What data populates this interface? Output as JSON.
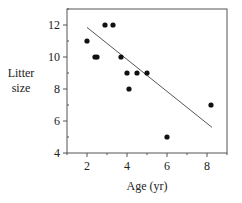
{
  "chart_data": {
    "type": "scatter",
    "title": "",
    "xlabel": "Age (yr)",
    "ylabel": [
      "Litter",
      "size"
    ],
    "xlim": [
      1,
      9
    ],
    "ylim": [
      4,
      13
    ],
    "x_ticks": [
      2,
      4,
      6,
      8
    ],
    "x_minor_ticks": [
      1,
      3,
      5,
      7,
      9
    ],
    "y_ticks": [
      4,
      6,
      8,
      10,
      12
    ],
    "y_minor_ticks": [
      5,
      7,
      9,
      11,
      13
    ],
    "grid": false,
    "legend": null,
    "series": [
      {
        "name": "observations",
        "type": "scatter",
        "points": [
          {
            "x": 2.0,
            "y": 11
          },
          {
            "x": 2.4,
            "y": 10
          },
          {
            "x": 2.5,
            "y": 10
          },
          {
            "x": 2.9,
            "y": 12
          },
          {
            "x": 3.3,
            "y": 12
          },
          {
            "x": 3.7,
            "y": 10
          },
          {
            "x": 4.0,
            "y": 9
          },
          {
            "x": 4.1,
            "y": 8
          },
          {
            "x": 4.5,
            "y": 9
          },
          {
            "x": 5.0,
            "y": 9
          },
          {
            "x": 6.0,
            "y": 5
          },
          {
            "x": 8.2,
            "y": 7
          }
        ]
      },
      {
        "name": "regression line",
        "type": "line",
        "points": [
          {
            "x": 2.0,
            "y": 11.85
          },
          {
            "x": 8.25,
            "y": 5.6
          }
        ]
      }
    ]
  },
  "colors": {
    "axis": "#555555",
    "point": "#111111",
    "line": "#555555",
    "text": "#222222"
  }
}
